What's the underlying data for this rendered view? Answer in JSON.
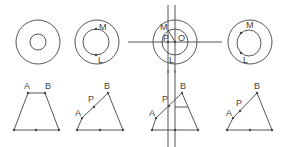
{
  "figure": {
    "top_row": {
      "circle_1": {
        "labels": []
      },
      "circle_2": {
        "labels": {
          "top": "M",
          "bottom": "L"
        }
      },
      "circle_3": {
        "labels": {
          "m": "M",
          "p": "P",
          "o": "O",
          "l": "L"
        }
      },
      "circle_4": {
        "labels": {
          "top": "M",
          "bottom": "L"
        }
      }
    },
    "bottom_row": {
      "trapezoid_1": {
        "labels": {
          "a": "A",
          "b": "B"
        }
      },
      "trapezoid_2": {
        "labels": {
          "a": "A",
          "p": "P",
          "b": "B"
        }
      },
      "trapezoid_3": {
        "labels": {
          "a": "A",
          "p": "P",
          "b": "B"
        }
      },
      "trapezoid_4": {
        "labels": {
          "a": "A",
          "p": "P",
          "b": "B"
        }
      }
    },
    "colors": {
      "line": "#555555",
      "text": "#444444",
      "background": "#ffffff"
    }
  }
}
